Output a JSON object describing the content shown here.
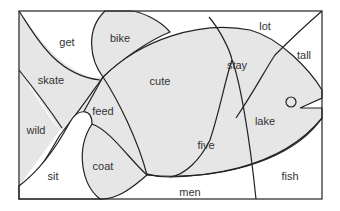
{
  "diagram": {
    "colors": {
      "shaded": "#e6e6e6",
      "unshaded": "#ffffff",
      "stroke": "#222222"
    },
    "regions": [
      {
        "id": "get",
        "label": "get",
        "shaded": false,
        "x": 67,
        "y": 42
      },
      {
        "id": "bike",
        "label": "bike",
        "shaded": true,
        "x": 120,
        "y": 38
      },
      {
        "id": "lot",
        "label": "lot",
        "shaded": false,
        "x": 265,
        "y": 26
      },
      {
        "id": "tall",
        "label": "tall",
        "shaded": false,
        "x": 304,
        "y": 55
      },
      {
        "id": "skate",
        "label": "skate",
        "shaded": true,
        "x": 51,
        "y": 80
      },
      {
        "id": "cute",
        "label": "cute",
        "shaded": true,
        "x": 160,
        "y": 81
      },
      {
        "id": "stay",
        "label": "stay",
        "shaded": true,
        "x": 237,
        "y": 65
      },
      {
        "id": "feed",
        "label": "feed",
        "shaded": true,
        "x": 103,
        "y": 111
      },
      {
        "id": "wild",
        "label": "wild",
        "shaded": true,
        "x": 36,
        "y": 130
      },
      {
        "id": "lake",
        "label": "lake",
        "shaded": true,
        "x": 265,
        "y": 121
      },
      {
        "id": "five",
        "label": "five",
        "shaded": true,
        "x": 206,
        "y": 145
      },
      {
        "id": "coat",
        "label": "coat",
        "shaded": true,
        "x": 103,
        "y": 166
      },
      {
        "id": "sit",
        "label": "sit",
        "shaded": false,
        "x": 53,
        "y": 176
      },
      {
        "id": "men",
        "label": "men",
        "shaded": false,
        "x": 190,
        "y": 192
      },
      {
        "id": "fish",
        "label": "fish",
        "shaded": false,
        "x": 290,
        "y": 176
      }
    ]
  }
}
